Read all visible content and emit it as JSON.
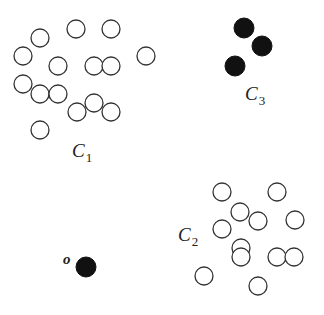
{
  "diagram": {
    "type": "cluster-scatter",
    "colors": {
      "open_stroke": "#333333",
      "filled": "#111111",
      "background": "#ffffff"
    },
    "radius": 9,
    "clusters": [
      {
        "id": "C1",
        "label": "C",
        "subscript": "1",
        "label_pos": [
          72,
          157
        ],
        "style": "open",
        "points": [
          [
            40,
            38
          ],
          [
            76,
            29
          ],
          [
            111,
            29
          ],
          [
            23,
            56
          ],
          [
            58,
            66
          ],
          [
            94,
            66
          ],
          [
            111,
            66
          ],
          [
            146,
            56
          ],
          [
            23,
            84
          ],
          [
            40,
            94
          ],
          [
            58,
            94
          ],
          [
            77,
            112
          ],
          [
            94,
            103
          ],
          [
            111,
            112
          ],
          [
            40,
            130
          ]
        ]
      },
      {
        "id": "C2",
        "label": "C",
        "subscript": "2",
        "label_pos": [
          178,
          241
        ],
        "style": "open",
        "points": [
          [
            222,
            192
          ],
          [
            277,
            192
          ],
          [
            240,
            212
          ],
          [
            258,
            221
          ],
          [
            295,
            220
          ],
          [
            222,
            229
          ],
          [
            241,
            248
          ],
          [
            241,
            257
          ],
          [
            277,
            257
          ],
          [
            294,
            257
          ],
          [
            204,
            276
          ],
          [
            258,
            286
          ]
        ]
      },
      {
        "id": "C3",
        "label": "C",
        "subscript": "3",
        "label_pos": [
          245,
          100
        ],
        "style": "filled",
        "points": [
          [
            244,
            28
          ],
          [
            262,
            46
          ],
          [
            235,
            66
          ]
        ]
      }
    ],
    "outlier": {
      "label": "o",
      "label_pos": [
        63,
        264
      ],
      "style": "filled",
      "point": [
        86,
        267
      ]
    }
  }
}
